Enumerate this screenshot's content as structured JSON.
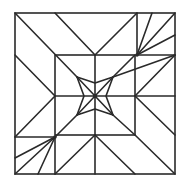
{
  "figure": {
    "stroke_color": "#2a2a2a",
    "background_color": "#ffffff",
    "stroke_width": 1.6,
    "outer_square": {
      "x1": 15,
      "y1": 13,
      "x2": 175,
      "y2": 174
    },
    "inner_square": {
      "x1": 55,
      "y1": 55,
      "x2": 135,
      "y2": 135
    },
    "center": {
      "x": 95,
      "y": 96
    },
    "star": {
      "tips": [
        {
          "x": 77,
          "y": 77
        },
        {
          "x": 113,
          "y": 77
        },
        {
          "x": 113,
          "y": 115
        },
        {
          "x": 77,
          "y": 115
        }
      ],
      "waist": [
        {
          "x": 95,
          "y": 83
        },
        {
          "x": 106,
          "y": 96
        },
        {
          "x": 95,
          "y": 109
        },
        {
          "x": 84,
          "y": 96
        }
      ]
    },
    "lines": [
      {
        "id": "tl-diag-outer",
        "x1": 15,
        "y1": 13,
        "x2": 77,
        "y2": 77
      },
      {
        "id": "top-diag-a",
        "x1": 55,
        "y1": 13,
        "x2": 95,
        "y2": 55
      },
      {
        "id": "top-diag-b",
        "x1": 95,
        "y1": 55,
        "x2": 137,
        "y2": 13
      },
      {
        "id": "tr-vertical",
        "x1": 137,
        "y1": 13,
        "x2": 137,
        "y2": 55
      },
      {
        "id": "tr-horizontal",
        "x1": 137,
        "y1": 55,
        "x2": 175,
        "y2": 55
      },
      {
        "id": "tr-diag",
        "x1": 175,
        "y1": 55,
        "x2": 113,
        "y2": 77
      },
      {
        "id": "right-diag-a",
        "x1": 175,
        "y1": 55,
        "x2": 135,
        "y2": 96
      },
      {
        "id": "right-horizontal",
        "x1": 135,
        "y1": 96,
        "x2": 175,
        "y2": 96
      },
      {
        "id": "right-diag-b",
        "x1": 135,
        "y1": 96,
        "x2": 175,
        "y2": 135
      },
      {
        "id": "left-diag-a",
        "x1": 15,
        "y1": 55,
        "x2": 55,
        "y2": 96
      },
      {
        "id": "left-diag-b",
        "x1": 55,
        "y1": 96,
        "x2": 15,
        "y2": 137
      },
      {
        "id": "bl-horizontal",
        "x1": 15,
        "y1": 137,
        "x2": 55,
        "y2": 137
      },
      {
        "id": "bl-vertical",
        "x1": 55,
        "y1": 137,
        "x2": 55,
        "y2": 174
      },
      {
        "id": "bottom-diag-a",
        "x1": 95,
        "y1": 135,
        "x2": 55,
        "y2": 174
      },
      {
        "id": "bottom-vertical",
        "x1": 95,
        "y1": 135,
        "x2": 95,
        "y2": 174
      },
      {
        "id": "bottom-diag-b",
        "x1": 95,
        "y1": 135,
        "x2": 135,
        "y2": 174
      },
      {
        "id": "br-diag",
        "x1": 135,
        "y1": 135,
        "x2": 175,
        "y2": 174
      },
      {
        "id": "center-horizontal-left",
        "x1": 55,
        "y1": 96,
        "x2": 95,
        "y2": 96
      },
      {
        "id": "center-vertical-top",
        "x1": 95,
        "y1": 55,
        "x2": 95,
        "y2": 96
      },
      {
        "id": "center-horizontal-right",
        "x1": 95,
        "y1": 96,
        "x2": 135,
        "y2": 96
      },
      {
        "id": "center-vertical-bottom",
        "x1": 95,
        "y1": 96,
        "x2": 95,
        "y2": 135
      },
      {
        "id": "br-star-diag",
        "x1": 113,
        "y1": 115,
        "x2": 135,
        "y2": 135
      },
      {
        "id": "bl-star-diag",
        "x1": 77,
        "y1": 115,
        "x2": 55,
        "y2": 137
      },
      {
        "id": "tr-star-diag",
        "x1": 113,
        "y1": 77,
        "x2": 135,
        "y2": 55
      }
    ],
    "fans": [
      {
        "id": "tr-fan",
        "vertex": {
          "x": 137,
          "y": 55
        },
        "targets": [
          {
            "x": 152,
            "y": 13
          },
          {
            "x": 175,
            "y": 13
          },
          {
            "x": 175,
            "y": 35
          }
        ]
      },
      {
        "id": "bl-fan",
        "vertex": {
          "x": 55,
          "y": 137
        },
        "targets": [
          {
            "x": 15,
            "y": 158
          },
          {
            "x": 15,
            "y": 174
          },
          {
            "x": 38,
            "y": 174
          }
        ]
      }
    ]
  }
}
